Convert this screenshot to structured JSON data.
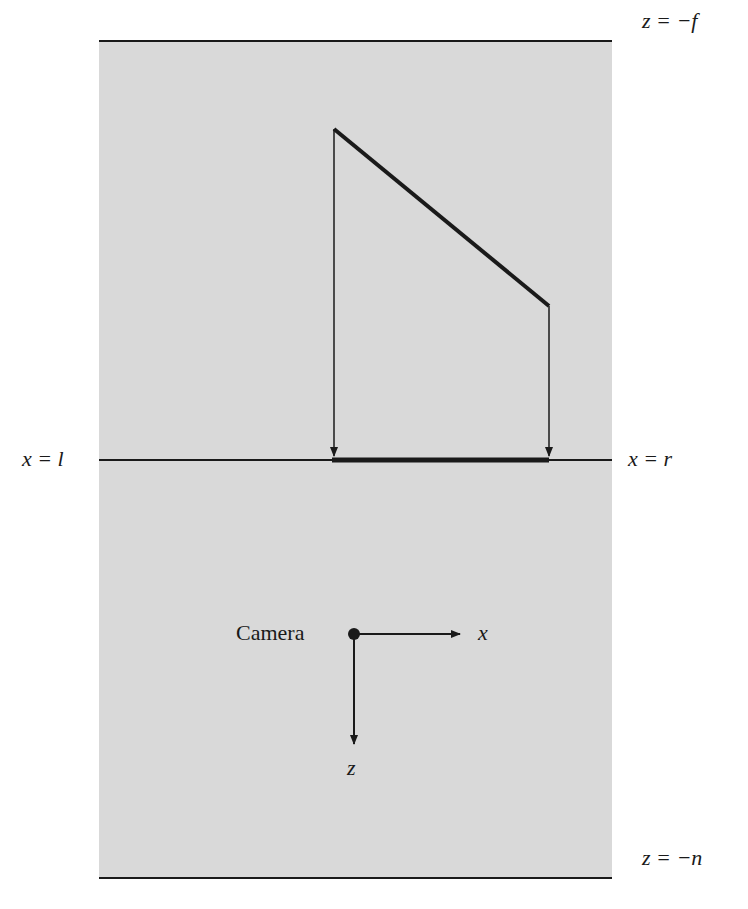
{
  "diagram": {
    "colors": {
      "volume_fill": "#d9d9d9",
      "stroke": "#1a1a1a",
      "background": "#ffffff"
    },
    "labels": {
      "far_plane": "z = −f",
      "near_plane": "z = −n",
      "left_plane": "x = l",
      "right_plane": "x = r",
      "camera": "Camera",
      "x_axis": "x",
      "z_axis": "z"
    },
    "object": {
      "vertices": [
        [
          334,
          129
        ],
        [
          549,
          306
        ]
      ],
      "projection_segment": [
        [
          332,
          460
        ],
        [
          549,
          460
        ]
      ]
    }
  }
}
